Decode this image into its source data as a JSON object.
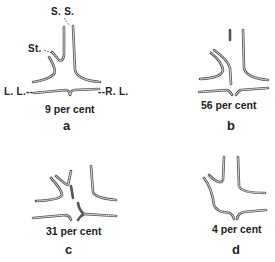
{
  "figure": {
    "panels": [
      {
        "id": "a",
        "letter": "a",
        "caption": "9 per cent",
        "percent": 9,
        "labels": {
          "superior_sinus": "S. S.",
          "straight_sinus": "St.",
          "left_lateral": "L. L.--",
          "right_lateral": "--R. L."
        }
      },
      {
        "id": "b",
        "letter": "b",
        "caption": "56 per cent",
        "percent": 56
      },
      {
        "id": "c",
        "letter": "c",
        "caption": "31 per cent",
        "percent": 31
      },
      {
        "id": "d",
        "letter": "d",
        "caption": "4 per cent",
        "percent": 4
      }
    ],
    "colors": {
      "line": "#555555",
      "text": "#222222",
      "background": "#ffffff"
    }
  }
}
